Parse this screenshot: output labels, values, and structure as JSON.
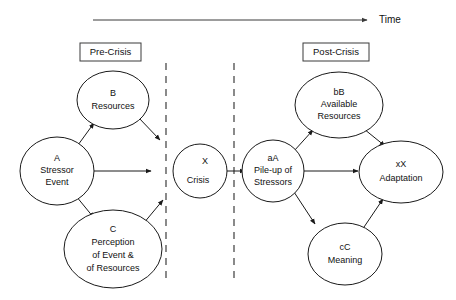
{
  "diagram": {
    "title_axis": "Time",
    "phases": [
      {
        "id": "pre-crisis",
        "label": "Pre-Crisis"
      },
      {
        "id": "post-crisis",
        "label": "Post-Crisis"
      }
    ],
    "nodes": [
      {
        "id": "a-stressor-event",
        "lines": [
          "A",
          "Stressor",
          "Event"
        ]
      },
      {
        "id": "b-resources",
        "lines": [
          "B",
          "Resources"
        ]
      },
      {
        "id": "c-perception",
        "lines": [
          "C",
          "Perception",
          "of Event &",
          "of Resources"
        ]
      },
      {
        "id": "x-crisis",
        "lines": [
          "X",
          "",
          "Crisis"
        ]
      },
      {
        "id": "aa-pileup",
        "lines": [
          "aA",
          "Pile-up of",
          "Stressors"
        ]
      },
      {
        "id": "bb-available",
        "lines": [
          "bB",
          "Available",
          "Resources"
        ]
      },
      {
        "id": "cc-meaning",
        "lines": [
          "cC",
          "Meaning"
        ]
      },
      {
        "id": "xx-adaptation",
        "lines": [
          "xX",
          "Adaptation"
        ]
      }
    ],
    "node_text": {
      "a_l1": "A",
      "a_l2": "Stressor",
      "a_l3": "Event",
      "b_l1": "B",
      "b_l2": "Resources",
      "c_l1": "C",
      "c_l2": "Perception",
      "c_l3": "of Event &",
      "c_l4": "of Resources",
      "x_l1": "X",
      "x_l2": "Crisis",
      "aa_l1": "aA",
      "aa_l2": "Pile-up of",
      "aa_l3": "Stressors",
      "bb_l1": "bB",
      "bb_l2": "Available",
      "bb_l3": "Resources",
      "cc_l1": "cC",
      "cc_l2": "Meaning",
      "xx_l1": "xX",
      "xx_l2": "Adaptation"
    },
    "edges": [
      {
        "id": "a-to-b",
        "from": "a-stressor-event",
        "to": "b-resources"
      },
      {
        "id": "a-to-x",
        "from": "a-stressor-event",
        "to": "x-crisis"
      },
      {
        "id": "a-to-c",
        "from": "a-stressor-event",
        "to": "c-perception"
      },
      {
        "id": "b-to-x",
        "from": "b-resources",
        "to": "x-crisis"
      },
      {
        "id": "c-to-x",
        "from": "c-perception",
        "to": "x-crisis"
      },
      {
        "id": "x-to-aa",
        "from": "x-crisis",
        "to": "aa-pileup"
      },
      {
        "id": "aa-to-bb",
        "from": "aa-pileup",
        "to": "bb-available"
      },
      {
        "id": "aa-to-xx",
        "from": "aa-pileup",
        "to": "xx-adaptation"
      },
      {
        "id": "aa-to-cc",
        "from": "aa-pileup",
        "to": "cc-meaning"
      },
      {
        "id": "bb-to-xx",
        "from": "bb-available",
        "to": "xx-adaptation"
      },
      {
        "id": "cc-to-xx",
        "from": "cc-meaning",
        "to": "xx-adaptation"
      }
    ],
    "colors": {
      "stroke": "#1a1a1a",
      "background": "#ffffff",
      "divider": "#2b2b2b"
    }
  }
}
